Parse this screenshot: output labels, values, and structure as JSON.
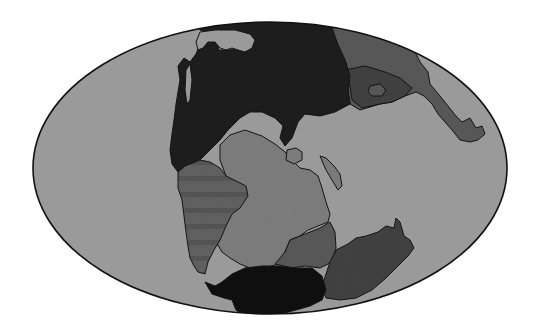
{
  "map": {
    "projection": "mollweide-ellipse",
    "style": "grayscale paleogeographic reconstruction",
    "colors": {
      "background": "#ffffff",
      "ocean": "#9a9a9a",
      "outline": "#111111",
      "landmass_darkest": "#0c0c0c",
      "landmass_dark": "#1a1a1a",
      "landmass_medium_dark": "#3e3e3e",
      "landmass_medium": "#555555",
      "landmass_light": "#7a7a7a",
      "landmass_striped": "#5e5e5e"
    },
    "regions": [
      {
        "id": "northern-block",
        "shade": "landmass_dark"
      },
      {
        "id": "eastern-arm",
        "shade": "landmass_medium"
      },
      {
        "id": "eastern-arm-inner",
        "shade": "landmass_medium_dark"
      },
      {
        "id": "central-block",
        "shade": "landmass_light"
      },
      {
        "id": "western-striped-block",
        "shade": "landmass_striped"
      },
      {
        "id": "southeast-block",
        "shade": "landmass_medium_dark"
      },
      {
        "id": "south-central-block",
        "shade": "landmass_medium"
      },
      {
        "id": "southern-polar-block",
        "shade": "landmass_darkest"
      },
      {
        "id": "small-island-1",
        "shade": "landmass_light"
      },
      {
        "id": "small-island-2",
        "shade": "landmass_light"
      }
    ]
  }
}
